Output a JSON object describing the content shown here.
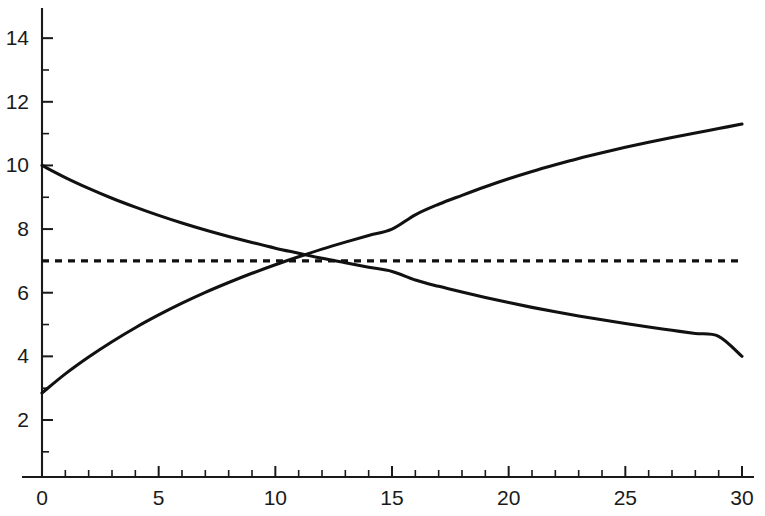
{
  "chart_data": {
    "type": "line",
    "title": "",
    "subtitle": "",
    "xlabel": "",
    "ylabel": "",
    "xlim": [
      0,
      30
    ],
    "ylim": [
      0.4,
      14.9
    ],
    "grid": false,
    "legend": null,
    "x_ticks": [
      0,
      5,
      10,
      15,
      20,
      25,
      30
    ],
    "x_tick_labels": [
      "0",
      "5",
      "10",
      "15",
      "20",
      "25",
      "30"
    ],
    "x_minor_step": 1,
    "y_ticks": [
      2,
      4,
      6,
      8,
      10,
      12,
      14
    ],
    "y_tick_labels": [
      "2",
      "4",
      "6",
      "8",
      "10",
      "12",
      "14"
    ],
    "y_minor_ticks": [
      1,
      3,
      5,
      7,
      9,
      11,
      13
    ],
    "crossing_point": {
      "x": 8.5,
      "y": 7.0
    },
    "series": [
      {
        "name": "rising-curve",
        "style": "solid",
        "color": "#111111",
        "x": [
          0,
          1,
          2,
          3,
          4,
          5,
          6,
          7,
          8,
          9,
          10,
          11,
          12,
          13,
          14,
          15,
          16,
          17,
          18,
          19,
          20,
          21,
          22,
          23,
          24,
          25,
          26,
          27,
          28,
          29,
          30
        ],
        "values": [
          2.85,
          3.45,
          3.98,
          4.46,
          4.9,
          5.3,
          5.67,
          6.01,
          6.32,
          6.61,
          6.88,
          7.13,
          7.37,
          7.59,
          7.8,
          8.0,
          8.45,
          8.78,
          9.06,
          9.33,
          9.58,
          9.81,
          10.02,
          10.22,
          10.4,
          10.57,
          10.73,
          10.88,
          11.02,
          11.16,
          11.3
        ]
      },
      {
        "name": "falling-curve",
        "style": "solid",
        "color": "#111111",
        "x": [
          0,
          1,
          2,
          3,
          4,
          5,
          6,
          7,
          8,
          9,
          10,
          11,
          12,
          13,
          14,
          15,
          16,
          17,
          18,
          19,
          20,
          21,
          22,
          23,
          24,
          25,
          26,
          27,
          28,
          29,
          30
        ],
        "values": [
          10.0,
          9.62,
          9.28,
          8.97,
          8.69,
          8.43,
          8.19,
          7.97,
          7.77,
          7.58,
          7.4,
          7.24,
          7.08,
          6.94,
          6.8,
          6.67,
          6.4,
          6.2,
          6.02,
          5.85,
          5.69,
          5.54,
          5.4,
          5.27,
          5.15,
          5.03,
          4.92,
          4.82,
          4.72,
          4.63,
          4.0
        ]
      },
      {
        "name": "equilibrium-line",
        "style": "dashed",
        "color": "#111111",
        "x": [
          0,
          30
        ],
        "values": [
          7.0,
          7.0
        ]
      }
    ]
  }
}
